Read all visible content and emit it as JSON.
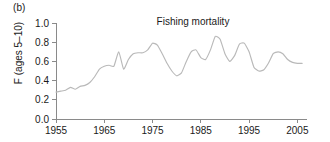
{
  "panel": {
    "label": "(b)"
  },
  "chart_data": {
    "type": "line",
    "title": "Fishing mortality",
    "xlabel": "",
    "ylabel": "F (ages 5–10)",
    "xlim": [
      1955,
      2007
    ],
    "ylim": [
      0.0,
      1.0
    ],
    "grid": false,
    "legend": null,
    "xticks": [
      1955,
      1965,
      1975,
      1985,
      1995,
      2005
    ],
    "xticklabels": [
      "1955",
      "1965",
      "1975",
      "1985",
      "1995",
      "2005"
    ],
    "yticks": [
      0.0,
      0.2,
      0.4,
      0.6,
      0.8,
      1.0
    ],
    "yticklabels": [
      "0.0",
      "0.2",
      "0.4",
      "0.6",
      "0.8",
      "1.0"
    ],
    "line_color": "#b9b9b9",
    "x": [
      1955,
      1956,
      1957,
      1958,
      1959,
      1960,
      1961,
      1962,
      1963,
      1964,
      1965,
      1966,
      1967,
      1968,
      1969,
      1970,
      1971,
      1972,
      1973,
      1974,
      1975,
      1976,
      1977,
      1978,
      1979,
      1980,
      1981,
      1982,
      1983,
      1984,
      1985,
      1986,
      1987,
      1988,
      1989,
      1990,
      1991,
      1992,
      1993,
      1994,
      1995,
      1996,
      1997,
      1998,
      1999,
      2000,
      2001,
      2002,
      2003,
      2004,
      2005,
      2006
    ],
    "y": [
      0.28,
      0.29,
      0.3,
      0.33,
      0.31,
      0.34,
      0.35,
      0.38,
      0.44,
      0.52,
      0.55,
      0.56,
      0.55,
      0.7,
      0.52,
      0.62,
      0.68,
      0.69,
      0.69,
      0.72,
      0.79,
      0.77,
      0.68,
      0.58,
      0.5,
      0.45,
      0.48,
      0.6,
      0.7,
      0.72,
      0.64,
      0.62,
      0.72,
      0.86,
      0.83,
      0.68,
      0.6,
      0.66,
      0.78,
      0.79,
      0.7,
      0.54,
      0.5,
      0.51,
      0.58,
      0.68,
      0.7,
      0.68,
      0.62,
      0.59,
      0.58,
      0.58
    ],
    "series": [
      {
        "name": "Fishing mortality",
        "values": [
          0.28,
          0.29,
          0.3,
          0.33,
          0.31,
          0.34,
          0.35,
          0.38,
          0.44,
          0.52,
          0.55,
          0.56,
          0.55,
          0.7,
          0.52,
          0.62,
          0.68,
          0.69,
          0.69,
          0.72,
          0.79,
          0.77,
          0.68,
          0.58,
          0.5,
          0.45,
          0.48,
          0.6,
          0.7,
          0.72,
          0.64,
          0.62,
          0.72,
          0.86,
          0.83,
          0.68,
          0.6,
          0.66,
          0.78,
          0.79,
          0.7,
          0.54,
          0.5,
          0.51,
          0.58,
          0.68,
          0.7,
          0.68,
          0.62,
          0.59,
          0.58,
          0.58
        ]
      }
    ]
  }
}
